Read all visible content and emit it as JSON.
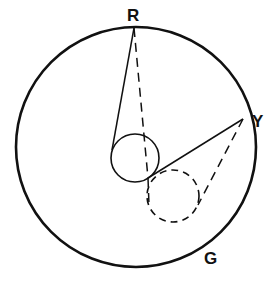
{
  "diagram": {
    "labels": {
      "r": "R",
      "y": "Y",
      "g": "G"
    },
    "colors": {
      "stroke": "#111111",
      "background": "#ffffff"
    },
    "elements": [
      "outer-circle",
      "small-solid-circle",
      "small-dashed-circle",
      "tangent-lines-solid",
      "tangent-lines-dashed"
    ]
  }
}
